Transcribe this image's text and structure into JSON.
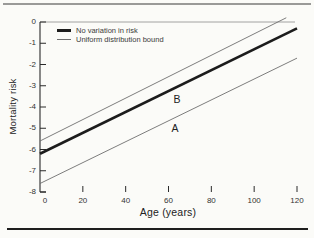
{
  "figure": {
    "background": "#fbfbf8",
    "top_rule_color": "#9a9a98",
    "bottom_rule_color": "#1e1e1e"
  },
  "legend": {
    "items": [
      {
        "label": "No variation in risk",
        "swatch": "thick-line"
      },
      {
        "label": "Uniform distribution bound",
        "swatch": "thin-line"
      }
    ]
  },
  "annotations": [
    {
      "text": "B",
      "age": 64,
      "risk": -3.6
    },
    {
      "text": "A",
      "age": 63,
      "risk": -5.0
    }
  ],
  "chart_data": {
    "type": "line",
    "title": "",
    "xlabel": "Age (years)",
    "ylabel": "Mortality risk",
    "xlim": [
      0,
      120
    ],
    "ylim": [
      -8,
      0
    ],
    "x_ticks": [
      0,
      20,
      40,
      60,
      80,
      100,
      120
    ],
    "y_ticks": [
      0,
      -1,
      -2,
      -3,
      -4,
      -5,
      -6,
      -7,
      -8
    ],
    "grid": false,
    "legend_position": "top-left",
    "axis_color": "#2a2a2a",
    "frame_top_color": "#8d8d8b",
    "series": [
      {
        "name": "No variation in risk",
        "style": "thick",
        "color": "#1c1c1c",
        "width": 2.6,
        "points": [
          [
            0,
            -6.2
          ],
          [
            120,
            -0.3
          ]
        ]
      },
      {
        "name": "Uniform distribution bound (upper)",
        "style": "thin",
        "color": "#6e6e6e",
        "width": 0.9,
        "points": [
          [
            0,
            -5.6
          ],
          [
            115,
            0.2
          ]
        ]
      },
      {
        "name": "Uniform distribution bound (lower)",
        "style": "thin",
        "color": "#6e6e6e",
        "width": 0.9,
        "points": [
          [
            0,
            -7.6
          ],
          [
            120,
            -1.7
          ]
        ]
      }
    ]
  }
}
